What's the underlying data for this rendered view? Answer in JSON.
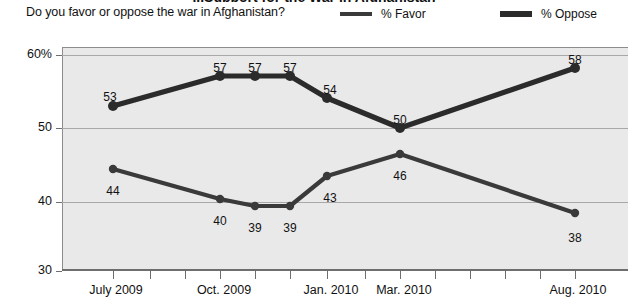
{
  "header": {
    "cropped_title": "...Support for the War in Afghanistan",
    "question": "Do you favor or oppose the war in Afghanistan?"
  },
  "legend": {
    "position": "top-right",
    "items": [
      {
        "name": "favor",
        "label": "% Favor",
        "color": "#3a3a3a"
      },
      {
        "name": "oppose",
        "label": "% Oppose",
        "color": "#2b2b2b"
      }
    ]
  },
  "axes": {
    "y_ticks": [
      "60%",
      "50",
      "40",
      "30"
    ],
    "x_ticks": [
      "July 2009",
      "Oct.  2009",
      "Jan. 2010",
      "Mar. 2010",
      "Aug. 2010"
    ]
  },
  "chart_data": {
    "type": "line",
    "title": "Support for the War in Afghanistan",
    "subtitle": "Do you favor or oppose the war in Afghanistan?",
    "xlabel": "",
    "ylabel": "",
    "ylim": [
      30,
      62
    ],
    "grid": true,
    "legend_position": "top-right",
    "x": [
      "July 2009",
      "Oct. 2009",
      "Nov. 2009",
      "Dec. 2009",
      "Jan. 2010",
      "Mar. 2010",
      "Aug. 2010"
    ],
    "tick_labels": [
      "July 2009",
      "Oct.  2009",
      "Jan. 2010",
      "Mar. 2010",
      "Aug. 2010"
    ],
    "series": [
      {
        "name": "% Favor",
        "color": "#3a3a3a",
        "values": [
          44,
          40,
          39,
          39,
          43,
          46,
          38
        ],
        "label_positions": [
          "below",
          "below",
          "below",
          "below",
          "below",
          "below",
          "below"
        ]
      },
      {
        "name": "% Oppose",
        "color": "#2b2b2b",
        "values": [
          53,
          57,
          57,
          57,
          54,
          50,
          58
        ],
        "label_positions": [
          "above",
          "above",
          "above",
          "above",
          "above",
          "above",
          "above"
        ]
      }
    ]
  },
  "points": {
    "favor": [
      {
        "label": "44",
        "cx": 113,
        "cy": 169,
        "lx": 113,
        "ly": 184
      },
      {
        "label": "40",
        "cx": 220,
        "cy": 199,
        "lx": 220,
        "ly": 214
      },
      {
        "label": "39",
        "cx": 255,
        "cy": 206,
        "lx": 255,
        "ly": 221
      },
      {
        "label": "39",
        "cx": 290,
        "cy": 206,
        "lx": 290,
        "ly": 221
      },
      {
        "label": "43",
        "cx": 327,
        "cy": 176,
        "lx": 330,
        "ly": 191
      },
      {
        "label": "46",
        "cx": 400,
        "cy": 154,
        "lx": 400,
        "ly": 169
      },
      {
        "label": "38",
        "cx": 575,
        "cy": 213,
        "lx": 575,
        "ly": 231
      }
    ],
    "oppose": [
      {
        "label": "53",
        "cx": 113,
        "cy": 106,
        "lx": 110,
        "ly": 90
      },
      {
        "label": "57",
        "cx": 220,
        "cy": 76,
        "lx": 220,
        "ly": 61
      },
      {
        "label": "57",
        "cx": 255,
        "cy": 76,
        "lx": 255,
        "ly": 61
      },
      {
        "label": "57",
        "cx": 290,
        "cy": 76,
        "lx": 290,
        "ly": 61
      },
      {
        "label": "54",
        "cx": 327,
        "cy": 98,
        "lx": 330,
        "ly": 83
      },
      {
        "label": "50",
        "cx": 400,
        "cy": 128,
        "lx": 400,
        "ly": 113
      },
      {
        "label": "58",
        "cx": 575,
        "cy": 68,
        "lx": 575,
        "ly": 53
      }
    ]
  },
  "geometry": {
    "y_gridlines": [
      {
        "value": "60%",
        "y": 55
      },
      {
        "value": "50",
        "y": 128
      },
      {
        "value": "40",
        "y": 202
      }
    ],
    "y_axis_labels": [
      {
        "text": "60%",
        "y": 47
      },
      {
        "text": "50",
        "y": 120
      },
      {
        "text": "40",
        "y": 194
      },
      {
        "text": "30",
        "y": 263
      }
    ],
    "x_tick_x": [
      113,
      150,
      185,
      220,
      255,
      290,
      327,
      365,
      400,
      435,
      470,
      505,
      540,
      575
    ],
    "x_label_positions": [
      {
        "text": "July 2009",
        "x": 116
      },
      {
        "text": "Oct.  2009",
        "x": 224
      },
      {
        "text": "Jan. 2010",
        "x": 331
      },
      {
        "text": "Mar. 2010",
        "x": 404
      },
      {
        "text": "Aug. 2010",
        "x": 578
      }
    ]
  }
}
